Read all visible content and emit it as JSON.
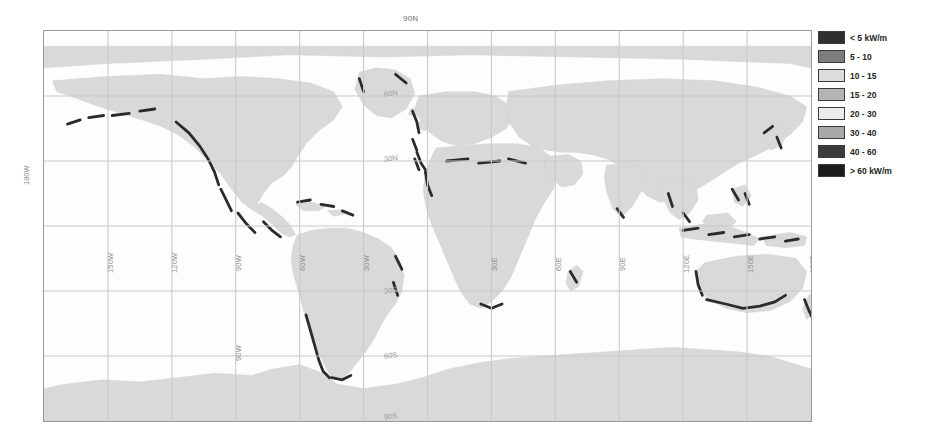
{
  "figure": {
    "title_top": "90N",
    "background": "#ffffff"
  },
  "map": {
    "projection": "equirectangular",
    "frame_color": "#9a9a9a",
    "ocean_color": "#fdfdfd",
    "land_color": "#d9d9d9",
    "graticule_color": "#c9c9c9",
    "coast_high_energy_color": "#2b2b2b",
    "longitude_labels": [
      {
        "label": "180W",
        "x_pct": 0
      },
      {
        "label": "150W",
        "x_pct": 8.333
      },
      {
        "label": "120W",
        "x_pct": 16.667
      },
      {
        "label": "90W",
        "x_pct": 25
      },
      {
        "label": "60W",
        "x_pct": 33.333
      },
      {
        "label": "30W",
        "x_pct": 41.667
      },
      {
        "label": "30E",
        "x_pct": 58.333
      },
      {
        "label": "60E",
        "x_pct": 66.667
      },
      {
        "label": "90E",
        "x_pct": 75
      },
      {
        "label": "120E",
        "x_pct": 83.333
      },
      {
        "label": "150E",
        "x_pct": 91.667
      },
      {
        "label": "180E",
        "x_pct": 100
      }
    ],
    "latitude_labels": [
      {
        "label": "90N",
        "y_pct": 0
      },
      {
        "label": "60N",
        "y_pct": 16.667
      },
      {
        "label": "30N",
        "y_pct": 33.333
      },
      {
        "label": "30S",
        "y_pct": 66.667
      },
      {
        "label": "60S",
        "y_pct": 83.333
      },
      {
        "label": "90S",
        "y_pct": 100
      }
    ]
  },
  "legend": {
    "units": "kW/m",
    "entries": [
      {
        "label": "< 5 kW/m",
        "color": "#303030"
      },
      {
        "label": "5 - 10",
        "color": "#7d7d7d"
      },
      {
        "label": "10 - 15",
        "color": "#dcdcdc"
      },
      {
        "label": "15 - 20",
        "color": "#b4b4b4"
      },
      {
        "label": "20 - 30",
        "color": "#ececec"
      },
      {
        "label": "30 - 40",
        "color": "#a8a8a8"
      },
      {
        "label": "40 - 60",
        "color": "#3c3c3c"
      },
      {
        "label": "> 60 kW/m",
        "color": "#1c1c1c"
      }
    ]
  }
}
